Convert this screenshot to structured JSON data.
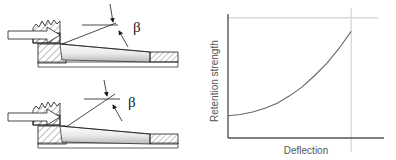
{
  "figure": {
    "panels": [
      {
        "id": "snap-fit-small-angle",
        "caption_symbol": "β",
        "description": "Cross-section of a snap-fit cantilever hook engaged in a housing with a small retention angle beta"
      },
      {
        "id": "snap-fit-large-angle",
        "caption_symbol": "β",
        "description": "Cross-section of a snap-fit cantilever hook engaged in a housing with a larger retention angle beta"
      }
    ],
    "angle_label_top": "β",
    "angle_label_bottom": "β",
    "colors": {
      "line": "#1a1a1a",
      "hatch": "#4d4d4d",
      "shade_light": "#f2f2f2",
      "shade_mid": "#cccccc",
      "axis": "#555555",
      "grid": "#d9d9d9",
      "curve": "#666666"
    }
  },
  "chart_data": {
    "type": "line",
    "title": "",
    "subtitle": "",
    "xlabel": "Deflection",
    "ylabel": "Retention strength",
    "x": [
      0,
      0.1,
      0.2,
      0.3,
      0.4,
      0.5,
      0.6,
      0.7,
      0.8,
      0.9,
      1.0
    ],
    "series": [
      {
        "name": "Retention strength vs deflection",
        "values": [
          0.18,
          0.19,
          0.21,
          0.24,
          0.28,
          0.34,
          0.41,
          0.5,
          0.6,
          0.72,
          0.86
        ]
      }
    ],
    "xlim": [
      0,
      1.08
    ],
    "ylim": [
      0,
      1.0
    ],
    "grid": true,
    "gridlines": {
      "horizontal": [
        0.97
      ],
      "vertical": [
        1.0
      ]
    },
    "tick_labels": {
      "x": [],
      "y": []
    },
    "legend": "none",
    "legend_position": "none",
    "annotations": []
  }
}
